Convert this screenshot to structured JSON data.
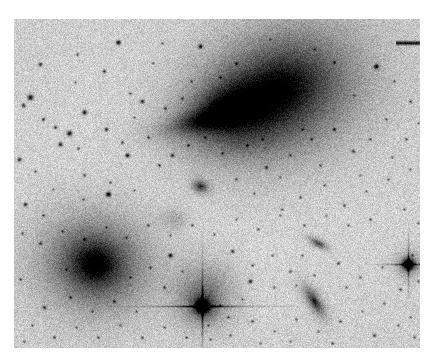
{
  "image": {
    "kind": "astronomical-plate-negative",
    "caption": "Negative grayscale astronomical plate image of a galaxy field",
    "frame": {
      "x": 14,
      "y": 19,
      "width": 406,
      "height": 329
    },
    "page": {
      "width": 429,
      "height": 360
    },
    "margin_color": "#ffffff",
    "sky_background_color": "#c6c6c6",
    "sky_background_light": "#d8d8d8",
    "ink_color": "#111111",
    "polarity": "negative (dark sources on light sky)",
    "noise": {
      "grain_amplitude": 26,
      "grain_scale": 1
    }
  },
  "chart_data": {
    "type": "scatter",
    "title": "",
    "xlabel": "",
    "ylabel": "",
    "coordinate_space": "frame pixels, origin at plate top-left (0,0) to (406,329)",
    "objects": [
      {
        "name": "diffuse-galaxy-main",
        "class": "diffuse elliptical galaxy with tidal plume",
        "x": 268,
        "y": 68,
        "rx": 66,
        "ry": 50,
        "angle": -22,
        "peak_darkness": 0.82,
        "falloff": 1.45
      },
      {
        "name": "diffuse-galaxy-secondary-lobe",
        "class": "secondary lobe / companion knot",
        "x": 214,
        "y": 86,
        "rx": 40,
        "ry": 26,
        "angle": -18,
        "peak_darkness": 0.66,
        "falloff": 1.5
      },
      {
        "name": "tidal-plume",
        "class": "tidal tail",
        "x": 192,
        "y": 100,
        "rx": 46,
        "ry": 12,
        "angle": -14,
        "peak_darkness": 0.55,
        "falloff": 1.7
      },
      {
        "name": "tidal-plume-faint-extension",
        "class": "tidal tail faint extension",
        "x": 222,
        "y": 112,
        "rx": 56,
        "ry": 30,
        "angle": -8,
        "peak_darkness": 0.24,
        "falloff": 2.0
      },
      {
        "name": "galaxy-halo-outer",
        "class": "outer diffuse halo",
        "x": 262,
        "y": 82,
        "rx": 104,
        "ry": 76,
        "angle": -20,
        "peak_darkness": 0.26,
        "falloff": 2.2
      },
      {
        "name": "elliptical-galaxy-lower-left",
        "class": "bright elliptical galaxy",
        "x": 81,
        "y": 245,
        "rx": 30,
        "ry": 27,
        "angle": 10,
        "peak_darkness": 0.96,
        "falloff": 1.25
      },
      {
        "name": "elliptical-galaxy-lower-left-halo",
        "class": "extended halo",
        "x": 81,
        "y": 243,
        "rx": 66,
        "ry": 58,
        "angle": 10,
        "peak_darkness": 0.36,
        "falloff": 2.1
      },
      {
        "name": "fuzzy-halo-around-bright-star",
        "class": "galaxy blended with foreground star",
        "x": 190,
        "y": 275,
        "rx": 33,
        "ry": 35,
        "angle": 0,
        "peak_darkness": 0.42,
        "falloff": 1.9
      },
      {
        "name": "edge-on-galaxy-lower-right",
        "class": "edge-on spiral galaxy",
        "x": 300,
        "y": 282,
        "rx": 16,
        "ry": 6,
        "angle": 58,
        "peak_darkness": 0.93,
        "falloff": 1.3
      },
      {
        "name": "small-galaxy-right-mid",
        "class": "small elongated galaxy",
        "x": 304,
        "y": 224,
        "rx": 10,
        "ry": 4,
        "angle": 28,
        "peak_darkness": 0.72,
        "falloff": 1.5
      },
      {
        "name": "compact-galaxy-center",
        "class": "compact fuzzy object",
        "x": 186,
        "y": 167,
        "rx": 8,
        "ry": 6,
        "angle": 20,
        "peak_darkness": 0.78,
        "falloff": 1.4
      },
      {
        "name": "faint-fuzz-center-left",
        "class": "faint diffuse patch",
        "x": 160,
        "y": 200,
        "rx": 14,
        "ry": 11,
        "angle": 0,
        "peak_darkness": 0.18,
        "falloff": 2.0
      }
    ],
    "bright_stars": [
      {
        "name": "bright-star-center-spikes",
        "x": 188,
        "y": 287,
        "core": 6.5,
        "spike_len_h": 96,
        "spike_len_v": 72,
        "spike_weight": 1.0,
        "darkness": 1.0
      },
      {
        "name": "bright-star-right-spikes",
        "x": 394,
        "y": 245,
        "core": 5.6,
        "spike_len_h": 44,
        "spike_len_v": 40,
        "spike_weight": 0.95,
        "darkness": 1.0
      }
    ],
    "marks": [
      {
        "name": "plate-scale-bar",
        "x1": 382,
        "y1": 24,
        "x2": 406,
        "y2": 24,
        "thickness": 2.6,
        "darkness": 0.92
      }
    ],
    "field_stars": [
      [
        26,
        45,
        2.0,
        0.75
      ],
      [
        63,
        35,
        1.5,
        0.55
      ],
      [
        104,
        23,
        2.4,
        0.88
      ],
      [
        186,
        27,
        2.1,
        0.8
      ],
      [
        139,
        44,
        1.3,
        0.5
      ],
      [
        16,
        78,
        2.8,
        0.92
      ],
      [
        9,
        86,
        2.0,
        0.7
      ],
      [
        29,
        100,
        1.8,
        0.65
      ],
      [
        90,
        52,
        1.8,
        0.62
      ],
      [
        116,
        74,
        1.5,
        0.5
      ],
      [
        61,
        63,
        1.3,
        0.45
      ],
      [
        128,
        82,
        2.0,
        0.7
      ],
      [
        70,
        93,
        2.4,
        0.85
      ],
      [
        41,
        108,
        1.8,
        0.6
      ],
      [
        55,
        114,
        2.6,
        0.9
      ],
      [
        46,
        125,
        2.2,
        0.78
      ],
      [
        64,
        129,
        1.6,
        0.55
      ],
      [
        92,
        110,
        2.0,
        0.7
      ],
      [
        120,
        98,
        1.4,
        0.48
      ],
      [
        151,
        89,
        1.6,
        0.55
      ],
      [
        168,
        79,
        1.5,
        0.5
      ],
      [
        108,
        123,
        1.7,
        0.6
      ],
      [
        134,
        118,
        1.5,
        0.52
      ],
      [
        113,
        136,
        2.2,
        0.8
      ],
      [
        145,
        146,
        1.7,
        0.58
      ],
      [
        5,
        140,
        2.0,
        0.7
      ],
      [
        21,
        152,
        1.4,
        0.5
      ],
      [
        70,
        156,
        1.6,
        0.55
      ],
      [
        96,
        163,
        1.5,
        0.5
      ],
      [
        39,
        170,
        1.3,
        0.45
      ],
      [
        11,
        185,
        2.0,
        0.72
      ],
      [
        94,
        175,
        2.6,
        0.9
      ],
      [
        69,
        180,
        1.4,
        0.5
      ],
      [
        29,
        196,
        1.6,
        0.55
      ],
      [
        120,
        171,
        1.3,
        0.45
      ],
      [
        158,
        136,
        1.9,
        0.66
      ],
      [
        174,
        126,
        1.5,
        0.5
      ],
      [
        191,
        118,
        1.3,
        0.45
      ],
      [
        208,
        134,
        1.4,
        0.48
      ],
      [
        233,
        126,
        1.5,
        0.5
      ],
      [
        252,
        148,
        1.7,
        0.58
      ],
      [
        276,
        136,
        1.3,
        0.45
      ],
      [
        297,
        120,
        1.5,
        0.5
      ],
      [
        320,
        110,
        1.8,
        0.62
      ],
      [
        339,
        132,
        1.7,
        0.6
      ],
      [
        356,
        120,
        1.5,
        0.5
      ],
      [
        372,
        100,
        1.4,
        0.48
      ],
      [
        362,
        47,
        2.4,
        0.86
      ],
      [
        380,
        62,
        1.4,
        0.48
      ],
      [
        396,
        82,
        1.6,
        0.55
      ],
      [
        340,
        76,
        1.3,
        0.45
      ],
      [
        320,
        43,
        1.5,
        0.5
      ],
      [
        300,
        30,
        1.4,
        0.48
      ],
      [
        256,
        20,
        1.3,
        0.42
      ],
      [
        222,
        44,
        1.6,
        0.55
      ],
      [
        206,
        58,
        1.4,
        0.48
      ],
      [
        177,
        62,
        1.3,
        0.45
      ],
      [
        148,
        24,
        1.4,
        0.48
      ],
      [
        222,
        160,
        1.5,
        0.5
      ],
      [
        240,
        174,
        1.4,
        0.48
      ],
      [
        266,
        158,
        1.3,
        0.45
      ],
      [
        286,
        178,
        1.5,
        0.5
      ],
      [
        310,
        166,
        1.4,
        0.48
      ],
      [
        330,
        186,
        1.6,
        0.55
      ],
      [
        352,
        172,
        1.4,
        0.48
      ],
      [
        374,
        160,
        1.5,
        0.5
      ],
      [
        390,
        190,
        1.4,
        0.48
      ],
      [
        396,
        150,
        1.3,
        0.45
      ],
      [
        356,
        200,
        1.6,
        0.55
      ],
      [
        334,
        206,
        1.4,
        0.48
      ],
      [
        312,
        196,
        1.3,
        0.45
      ],
      [
        290,
        206,
        1.5,
        0.52
      ],
      [
        266,
        196,
        1.4,
        0.48
      ],
      [
        244,
        210,
        1.5,
        0.5
      ],
      [
        222,
        200,
        1.3,
        0.45
      ],
      [
        200,
        215,
        1.4,
        0.48
      ],
      [
        178,
        206,
        1.5,
        0.5
      ],
      [
        156,
        216,
        1.3,
        0.45
      ],
      [
        134,
        206,
        1.6,
        0.55
      ],
      [
        112,
        218,
        1.4,
        0.48
      ],
      [
        92,
        208,
        1.3,
        0.45
      ],
      [
        70,
        220,
        1.5,
        0.5
      ],
      [
        48,
        212,
        1.4,
        0.48
      ],
      [
        26,
        224,
        1.6,
        0.55
      ],
      [
        8,
        214,
        1.4,
        0.48
      ],
      [
        156,
        236,
        2.2,
        0.8
      ],
      [
        136,
        248,
        1.5,
        0.5
      ],
      [
        116,
        258,
        1.4,
        0.48
      ],
      [
        150,
        268,
        1.6,
        0.55
      ],
      [
        168,
        252,
        1.3,
        0.45
      ],
      [
        218,
        232,
        1.8,
        0.62
      ],
      [
        238,
        246,
        1.5,
        0.5
      ],
      [
        258,
        236,
        1.4,
        0.48
      ],
      [
        276,
        252,
        1.6,
        0.55
      ],
      [
        236,
        262,
        2.0,
        0.72
      ],
      [
        288,
        236,
        1.4,
        0.48
      ],
      [
        260,
        268,
        1.5,
        0.5
      ],
      [
        282,
        266,
        1.3,
        0.45
      ],
      [
        300,
        256,
        1.4,
        0.48
      ],
      [
        324,
        244,
        1.7,
        0.6
      ],
      [
        346,
        258,
        1.5,
        0.5
      ],
      [
        368,
        248,
        1.4,
        0.48
      ],
      [
        386,
        270,
        1.6,
        0.55
      ],
      [
        398,
        236,
        1.4,
        0.48
      ],
      [
        370,
        284,
        1.5,
        0.5
      ],
      [
        348,
        292,
        1.4,
        0.48
      ],
      [
        326,
        302,
        1.6,
        0.55
      ],
      [
        304,
        312,
        1.4,
        0.48
      ],
      [
        282,
        300,
        1.5,
        0.5
      ],
      [
        260,
        312,
        1.3,
        0.45
      ],
      [
        238,
        302,
        1.6,
        0.55
      ],
      [
        216,
        316,
        1.4,
        0.48
      ],
      [
        194,
        306,
        1.3,
        0.45
      ],
      [
        172,
        318,
        1.5,
        0.5
      ],
      [
        150,
        308,
        1.4,
        0.48
      ],
      [
        128,
        318,
        1.6,
        0.55
      ],
      [
        106,
        306,
        1.4,
        0.48
      ],
      [
        84,
        318,
        1.5,
        0.5
      ],
      [
        62,
        308,
        1.3,
        0.45
      ],
      [
        40,
        318,
        1.6,
        0.55
      ],
      [
        18,
        306,
        1.4,
        0.48
      ],
      [
        30,
        288,
        1.8,
        0.64
      ],
      [
        56,
        278,
        1.5,
        0.5
      ],
      [
        78,
        292,
        1.4,
        0.48
      ],
      [
        100,
        282,
        1.6,
        0.55
      ],
      [
        122,
        292,
        1.3,
        0.45
      ],
      [
        206,
        286,
        1.4,
        0.48
      ],
      [
        214,
        298,
        1.5,
        0.5
      ],
      [
        228,
        280,
        1.3,
        0.45
      ],
      [
        332,
        268,
        1.4,
        0.48
      ],
      [
        360,
        316,
        1.7,
        0.6
      ],
      [
        384,
        306,
        1.4,
        0.48
      ],
      [
        400,
        318,
        1.5,
        0.5
      ],
      [
        396,
        298,
        1.3,
        0.45
      ],
      [
        404,
        262,
        1.4,
        0.48
      ],
      [
        392,
        120,
        1.5,
        0.5
      ],
      [
        404,
        104,
        1.3,
        0.45
      ],
      [
        378,
        138,
        1.4,
        0.48
      ],
      [
        346,
        156,
        1.3,
        0.45
      ],
      [
        306,
        146,
        1.4,
        0.48
      ],
      [
        288,
        110,
        1.3,
        0.45
      ],
      [
        268,
        190,
        1.4,
        0.48
      ],
      [
        248,
        120,
        1.3,
        0.42
      ],
      [
        210,
        96,
        1.2,
        0.4
      ],
      [
        246,
        90,
        1.2,
        0.4
      ],
      [
        84,
        240,
        1.2,
        0.38
      ],
      [
        52,
        250,
        1.3,
        0.42
      ],
      [
        196,
        320,
        1.3,
        0.42
      ],
      [
        6,
        260,
        1.5,
        0.5
      ],
      [
        10,
        322,
        1.4,
        0.48
      ],
      [
        404,
        204,
        1.4,
        0.48
      ],
      [
        408,
        174,
        1.3,
        0.45
      ],
      [
        246,
        324,
        1.4,
        0.48
      ],
      [
        276,
        322,
        1.3,
        0.42
      ],
      [
        318,
        324,
        1.5,
        0.5
      ]
    ],
    "star_chain_note": "diagonal chain of stars running upper-left to lower-right in the left quadrant"
  }
}
